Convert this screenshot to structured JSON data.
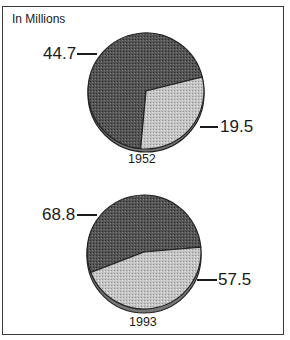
{
  "chart_data": [
    {
      "type": "pie",
      "title": "1952",
      "unit_label": "In Millions",
      "categories": [
        "Dark segment",
        "Light segment"
      ],
      "values": [
        44.7,
        19.5
      ],
      "colors": [
        "#4a4a4a",
        "#bdbdbd"
      ]
    },
    {
      "type": "pie",
      "title": "1993",
      "unit_label": "In Millions",
      "categories": [
        "Dark segment",
        "Light segment"
      ],
      "values": [
        68.8,
        57.5
      ],
      "colors": [
        "#4a4a4a",
        "#bdbdbd"
      ]
    }
  ],
  "header": {
    "unit_label": "In Millions"
  },
  "pies": [
    {
      "year": "1952",
      "dark_label": "44.7",
      "light_label": "19.5"
    },
    {
      "year": "1993",
      "dark_label": "68.8",
      "light_label": "57.5"
    }
  ]
}
